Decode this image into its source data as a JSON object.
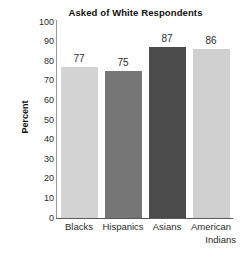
{
  "chart_data": {
    "type": "bar",
    "title": "Asked of White Respondents",
    "xlabel": "",
    "ylabel": "Percent",
    "categories": [
      "Blacks",
      "Hispanics",
      "Asians",
      "American Indians"
    ],
    "category_lines": [
      [
        "Blacks"
      ],
      [
        "Hispanics"
      ],
      [
        "Asians"
      ],
      [
        "American",
        "Indians"
      ]
    ],
    "values": [
      77,
      75,
      87,
      86
    ],
    "value_labels": [
      "77",
      "75",
      "87",
      "86"
    ],
    "ylim": [
      0,
      100
    ],
    "ytick_labels": [
      "100",
      "90",
      "80",
      "70",
      "60",
      "50",
      "40",
      "30",
      "20",
      "10",
      "0"
    ],
    "ytick_values": [
      100,
      90,
      80,
      70,
      60,
      50,
      40,
      30,
      20,
      10,
      0
    ],
    "grid": false,
    "legend": "none",
    "bar_colors": [
      "#d3d3d3",
      "#767676",
      "#4b4b4b",
      "#d0d0d0"
    ],
    "axis_color": "#5a5a5a",
    "background": "#ffffff",
    "text_color": "#2b2b2b"
  }
}
